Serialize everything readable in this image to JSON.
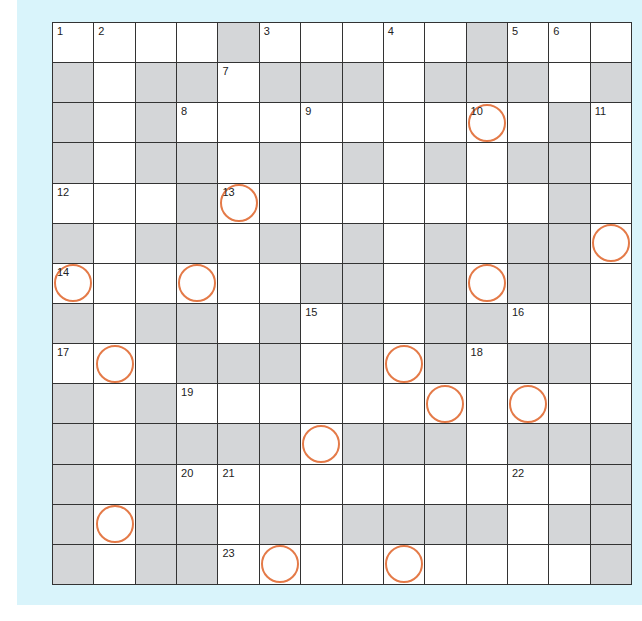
{
  "puzzle": {
    "type": "crossword",
    "rows": 14,
    "cols": 14,
    "colors": {
      "background": "#d9f4fb",
      "white_cell": "#ffffff",
      "block_cell": "#d4d6d8",
      "grid_line": "#333333",
      "circle": "#e47a48"
    },
    "legend": "W = white cell, B = shaded block, number = clue number, * = circled cell",
    "grid": [
      [
        "1",
        "2",
        "W",
        "W",
        "B",
        "3",
        "W",
        "W",
        "4",
        "W",
        "B",
        "5",
        "6",
        "W"
      ],
      [
        "B",
        "W",
        "B",
        "B",
        "7",
        "B",
        "B",
        "B",
        "W",
        "B",
        "B",
        "B",
        "W",
        "B"
      ],
      [
        "B",
        "W",
        "B",
        "8",
        "W",
        "W",
        "9",
        "W",
        "W",
        "W",
        "10*",
        "W",
        "B",
        "11"
      ],
      [
        "B",
        "W",
        "B",
        "B",
        "W",
        "B",
        "W",
        "B",
        "W",
        "B",
        "W",
        "B",
        "B",
        "W"
      ],
      [
        "12",
        "W",
        "W",
        "B",
        "13*",
        "W",
        "W",
        "W",
        "W",
        "W",
        "W",
        "W",
        "B",
        "W"
      ],
      [
        "B",
        "W",
        "B",
        "B",
        "W",
        "B",
        "W",
        "B",
        "W",
        "B",
        "W",
        "B",
        "B",
        "W*"
      ],
      [
        "14*",
        "W",
        "W",
        "W*",
        "W",
        "W",
        "B",
        "B",
        "W",
        "B",
        "W*",
        "B",
        "B",
        "W"
      ],
      [
        "B",
        "W",
        "B",
        "B",
        "W",
        "B",
        "15",
        "B",
        "W",
        "B",
        "B",
        "16",
        "W",
        "W"
      ],
      [
        "17",
        "W*",
        "W",
        "B",
        "B",
        "B",
        "W",
        "B",
        "W*",
        "B",
        "18",
        "B",
        "B",
        "W"
      ],
      [
        "B",
        "W",
        "B",
        "19",
        "W",
        "W",
        "W",
        "W",
        "W",
        "W*",
        "W",
        "W*",
        "W",
        "W"
      ],
      [
        "B",
        "W",
        "B",
        "B",
        "B",
        "B",
        "W*",
        "B",
        "B",
        "B",
        "W",
        "B",
        "B",
        "B"
      ],
      [
        "B",
        "W",
        "B",
        "20",
        "21",
        "W",
        "W",
        "W",
        "W",
        "W",
        "W",
        "22",
        "W",
        "B"
      ],
      [
        "B",
        "W*",
        "B",
        "B",
        "W",
        "B",
        "W",
        "B",
        "B",
        "B",
        "B",
        "W",
        "B",
        "B"
      ],
      [
        "B",
        "W",
        "B",
        "B",
        "23",
        "W*",
        "W",
        "W",
        "W*",
        "W",
        "W",
        "W",
        "W",
        "B"
      ]
    ]
  }
}
